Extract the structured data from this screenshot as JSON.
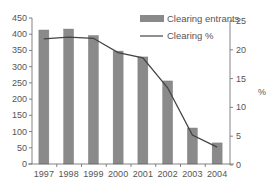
{
  "chart_data": {
    "type": "bar",
    "title": "",
    "xlabel": "",
    "ylabel": "",
    "y2label": "%",
    "categories": [
      "1997",
      "1998",
      "1999",
      "2000",
      "2001",
      "2002",
      "2003",
      "2004"
    ],
    "series": [
      {
        "name": "Clearing entrants",
        "type": "bar",
        "axis": "left",
        "values": [
          413,
          416,
          396,
          348,
          330,
          256,
          111,
          65
        ],
        "color": "#8a8a8a"
      },
      {
        "name": "Clearing %",
        "type": "line",
        "axis": "right",
        "values": [
          21.9,
          22.2,
          22.0,
          19.5,
          18.6,
          13.4,
          5.2,
          3.1
        ],
        "color": "#444444"
      }
    ],
    "ylim": [
      0,
      450
    ],
    "yticks": [
      0,
      50,
      100,
      150,
      200,
      250,
      300,
      350,
      400,
      450
    ],
    "y2lim": [
      0,
      25
    ],
    "y2ticks": [
      0,
      5,
      10,
      15,
      20,
      25
    ],
    "grid": false,
    "legend": {
      "position": "top-right",
      "entries": [
        "Clearing entrants",
        "Clearing %"
      ]
    }
  }
}
